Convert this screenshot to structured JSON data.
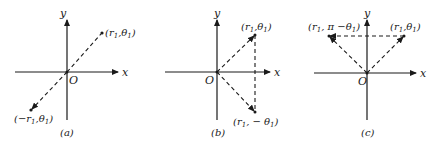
{
  "figure": {
    "panels": [
      {
        "id": "a",
        "caption": "(a)",
        "x_axis_label": "x",
        "y_axis_label": "y",
        "origin_label": "O",
        "points": [
          {
            "label": "(r1,θ1)",
            "role": "original"
          },
          {
            "label": "(−r1,θ1)",
            "role": "reflection-through-origin"
          }
        ]
      },
      {
        "id": "b",
        "caption": "(b)",
        "x_axis_label": "x",
        "y_axis_label": "y",
        "origin_label": "O",
        "points": [
          {
            "label": "(r1,θ1)",
            "role": "original"
          },
          {
            "label": "(r1, − θ1)",
            "role": "reflection-across-x-axis"
          }
        ]
      },
      {
        "id": "c",
        "caption": "(c)",
        "x_axis_label": "x",
        "y_axis_label": "y",
        "origin_label": "O",
        "points": [
          {
            "label": "(r1,θ1)",
            "role": "original"
          },
          {
            "label": "(r1, π −θ1)",
            "role": "reflection-across-y-axis"
          }
        ]
      }
    ]
  }
}
